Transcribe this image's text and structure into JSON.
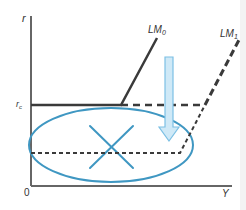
{
  "diagram": {
    "axes": {
      "y_label": "r",
      "x_label": "Y",
      "origin_label": "0",
      "rc_label_main": "r",
      "rc_label_sub": "c"
    },
    "curves": {
      "lm0_label_main": "LM",
      "lm0_label_sub": "0",
      "lm1_label_main": "LM",
      "lm1_label_sub": "1"
    },
    "colors": {
      "axis": "#555555",
      "curve": "#3a3a3a",
      "highlight": "#3f97c2",
      "arrow_fill": "#cfe9f7",
      "arrow_stroke": "#7cc0e4"
    }
  }
}
